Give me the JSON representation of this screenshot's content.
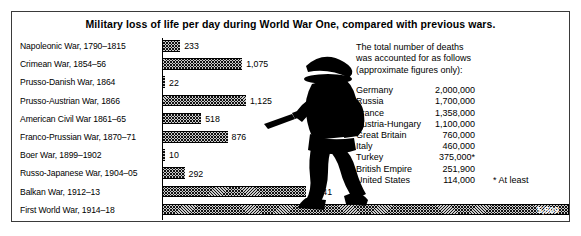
{
  "title": "Military loss of life per day during World War One,  compared with previous wars.",
  "chart_data": {
    "type": "bar",
    "title": "Military loss of life per day during World War One, compared with previous wars.",
    "xlabel": "",
    "ylabel": "",
    "orientation": "horizontal",
    "xlim": [
      0,
      5509
    ],
    "grid": false,
    "legend": "none",
    "categories": [
      "Napoleonic War, 1790–1815",
      "Crimean War, 1854–56",
      "Prusso-Danish War, 1864",
      "Prusso-Austrian War, 1866",
      "American Civil War 1861–65",
      "Franco-Prussian War, 1870–71",
      "Boer War, 1899–1902",
      "Russo-Japanese War, 1904–05",
      "Balkan War, 1912–13",
      "First World War, 1914–18"
    ],
    "values": [
      233,
      1075,
      22,
      1125,
      518,
      876,
      10,
      292,
      1941,
      5509
    ],
    "value_labels": [
      "233",
      "1,075",
      "22",
      "1,125",
      "518",
      "876",
      "10",
      "292",
      "1,941",
      "5,509"
    ]
  },
  "info": {
    "intro_line1": "The total  number of deaths",
    "intro_line2": "was accounted for as  follows",
    "intro_line3": "(approximate figures only):",
    "rows": [
      {
        "country": "Germany",
        "deaths": "2,000,000"
      },
      {
        "country": "Russia",
        "deaths": "1,700,000"
      },
      {
        "country": "France",
        "deaths": "1,358,000"
      },
      {
        "country": "Austria-Hungary",
        "deaths": "1,100,000"
      },
      {
        "country": "Great Britain",
        "deaths": "760,000"
      },
      {
        "country": "Italy",
        "deaths": "460,000"
      },
      {
        "country": "Turkey",
        "deaths": "375,000*"
      },
      {
        "country": "British Empire",
        "deaths": "251,900"
      },
      {
        "country": "United States",
        "deaths": "114,000"
      }
    ],
    "footnote": "* At least"
  },
  "illustration": {
    "name": "soldier-silhouette"
  },
  "colors": {
    "ink": "#000000",
    "bar_fill": "#cccccc",
    "frame": "#3a3a3a"
  }
}
